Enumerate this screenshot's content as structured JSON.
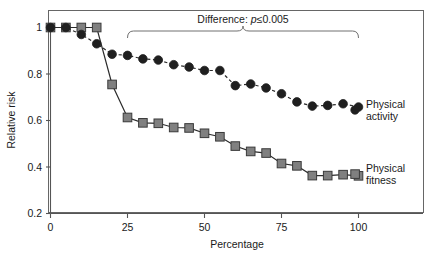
{
  "chart_data": {
    "type": "line",
    "title": "",
    "xlabel": "Percentage",
    "ylabel": "Relative risk",
    "xlim": [
      0,
      110
    ],
    "ylim": [
      0.2,
      1.04
    ],
    "xticks": [
      0,
      25,
      50,
      75,
      100
    ],
    "xticklabels": [
      "0",
      "25",
      "50",
      "75",
      "100"
    ],
    "yticks": [
      0.2,
      0.4,
      0.6,
      0.8,
      1.0
    ],
    "yticklabels": [
      "0.2",
      "0.4",
      "0.6",
      "0.8",
      "1"
    ],
    "grid": false,
    "legend_position": "right-inline",
    "series": [
      {
        "name": "Physical activity",
        "marker": "circle",
        "marker_color": "#1f1f1f",
        "line_style": "dashed",
        "x": [
          0,
          5,
          10,
          15,
          20,
          25,
          30,
          35,
          40,
          45,
          50,
          55,
          60,
          65,
          70,
          75,
          80,
          85,
          90,
          95,
          100
        ],
        "values": [
          1.0,
          1.0,
          0.97,
          0.93,
          0.885,
          0.88,
          0.865,
          0.86,
          0.84,
          0.83,
          0.815,
          0.815,
          0.75,
          0.757,
          0.74,
          0.715,
          0.68,
          0.662,
          0.665,
          0.672,
          0.658
        ]
      },
      {
        "name": "Physical fitness",
        "marker": "square",
        "marker_color": "#808080",
        "line_style": "solid",
        "x": [
          0,
          5,
          10,
          15,
          20,
          25,
          30,
          35,
          40,
          45,
          50,
          55,
          60,
          65,
          70,
          75,
          80,
          85,
          90,
          95,
          100
        ],
        "values": [
          1.0,
          1.0,
          1.0,
          1.0,
          0.755,
          0.613,
          0.59,
          0.588,
          0.57,
          0.568,
          0.545,
          0.53,
          0.49,
          0.467,
          0.46,
          0.415,
          0.405,
          0.363,
          0.363,
          0.367,
          0.362
        ]
      }
    ],
    "annotations": [
      {
        "name": "difference-bracket",
        "text_prefix": "Difference: ",
        "text_italic": "p",
        "text_suffix": "≤0.005",
        "x_start": 25,
        "x_end": 100
      }
    ],
    "legend_labels": [
      {
        "line1": "Physical",
        "line2": "activity"
      },
      {
        "line1": "Physical",
        "line2": "fitness"
      }
    ]
  },
  "colors": {
    "activity_marker": "#1f1f1f",
    "fitness_marker": "#808080",
    "axis": "#555555",
    "frame": "#666666",
    "bracket": "#707070",
    "background": "#ffffff"
  }
}
